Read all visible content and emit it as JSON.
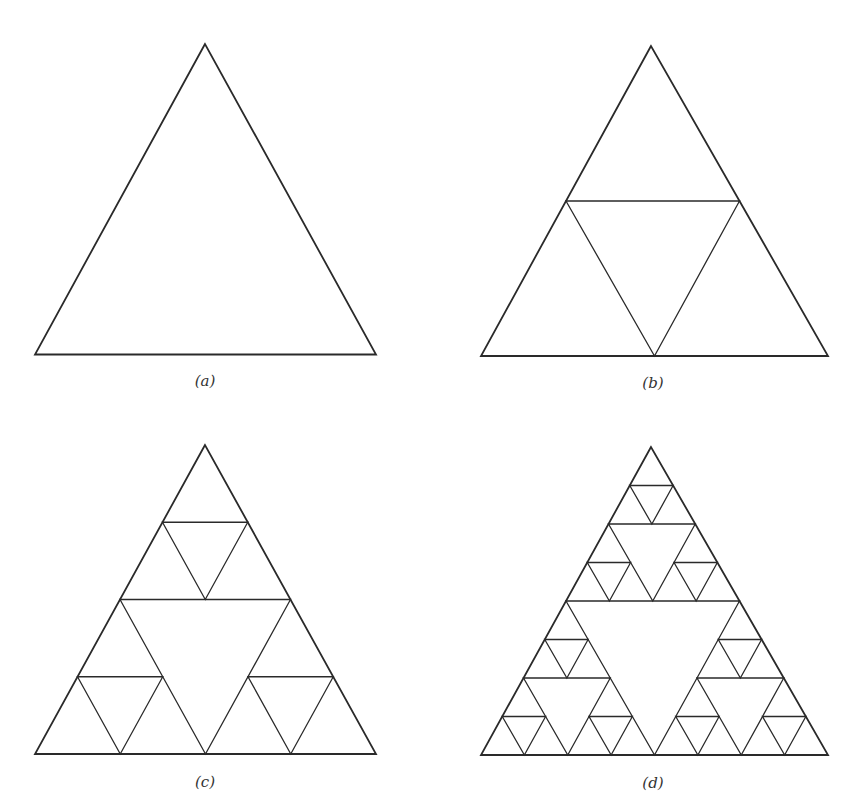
{
  "figure": {
    "stroke_color": "#2a2a2a",
    "outer_stroke_width": 1.8,
    "inner_stroke_width": 1.3,
    "panels": [
      {
        "id": "a",
        "label": "(a)",
        "depth": 0,
        "apex": [
          205,
          44
        ],
        "base_left": [
          35,
          354.5
        ],
        "base_right": [
          376,
          354.5
        ],
        "label_pos": [
          205,
          381
        ]
      },
      {
        "id": "b",
        "label": "(b)",
        "depth": 1,
        "apex": [
          651,
          46
        ],
        "base_left": [
          481,
          356
        ],
        "base_right": [
          828,
          356
        ],
        "label_pos": [
          653,
          383
        ]
      },
      {
        "id": "c",
        "label": "(c)",
        "depth": 2,
        "apex": [
          205,
          445
        ],
        "base_left": [
          35,
          754
        ],
        "base_right": [
          376,
          754
        ],
        "label_pos": [
          205,
          782
        ]
      },
      {
        "id": "d",
        "label": "(d)",
        "depth": 3,
        "apex": [
          651,
          447
        ],
        "base_left": [
          481,
          755
        ],
        "base_right": [
          828,
          755
        ],
        "label_pos": [
          653,
          783
        ]
      }
    ]
  }
}
